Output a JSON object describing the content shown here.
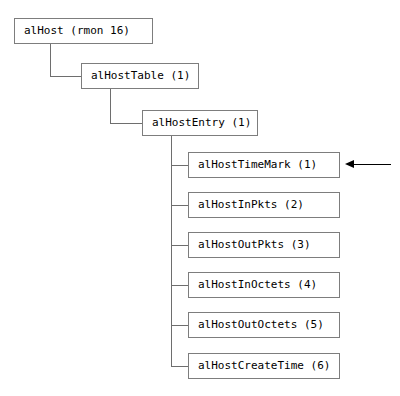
{
  "diagram": {
    "colors": {
      "background": "#ffffff",
      "box_border": "#7d7d7d",
      "edge": "#6e6e6e",
      "arrow": "#000000",
      "text": "#000000"
    },
    "nodes": [
      {
        "id": "alhost",
        "label": "alHost (rmon 16)",
        "x": 14,
        "y": 18,
        "width": 139
      },
      {
        "id": "alhosttable",
        "label": "alHostTable (1)",
        "x": 81,
        "y": 63,
        "width": 118
      },
      {
        "id": "alhostentry",
        "label": "alHostEntry (1)",
        "x": 142,
        "y": 110,
        "width": 116
      },
      {
        "id": "alhosttimemark",
        "label": "alHostTimeMark (1)",
        "x": 188,
        "y": 152,
        "width": 152
      },
      {
        "id": "alhostinpkts",
        "label": "alHostInPkts (2)",
        "x": 188,
        "y": 192,
        "width": 152
      },
      {
        "id": "alhostoutpkts",
        "label": "alHostOutPkts (3)",
        "x": 188,
        "y": 232,
        "width": 152
      },
      {
        "id": "alhostinoctets",
        "label": "alHostInOctets (4)",
        "x": 188,
        "y": 272,
        "width": 152
      },
      {
        "id": "alhostoutoctets",
        "label": "alHostOutOctets (5)",
        "x": 188,
        "y": 312,
        "width": 152
      },
      {
        "id": "alhostcreatetime",
        "label": "alHostCreateTime (6)",
        "x": 188,
        "y": 353,
        "width": 152
      }
    ],
    "edges": [
      {
        "id": "e-alhost-down",
        "orient": "v",
        "x": 50,
        "y": 44,
        "length": 33
      },
      {
        "id": "e-alhost-right",
        "orient": "h",
        "x": 50,
        "y": 76,
        "length": 32
      },
      {
        "id": "e-alhosttable-down",
        "orient": "v",
        "x": 110,
        "y": 89,
        "length": 35
      },
      {
        "id": "e-alhosttable-right",
        "orient": "h",
        "x": 110,
        "y": 123,
        "length": 33
      },
      {
        "id": "e-trunk",
        "orient": "v",
        "x": 171,
        "y": 136,
        "length": 231
      },
      {
        "id": "e-leaf-1",
        "orient": "h",
        "x": 171,
        "y": 165,
        "length": 18
      },
      {
        "id": "e-leaf-2",
        "orient": "h",
        "x": 171,
        "y": 205,
        "length": 18
      },
      {
        "id": "e-leaf-3",
        "orient": "h",
        "x": 171,
        "y": 245,
        "length": 18
      },
      {
        "id": "e-leaf-4",
        "orient": "h",
        "x": 171,
        "y": 285,
        "length": 18
      },
      {
        "id": "e-leaf-5",
        "orient": "h",
        "x": 171,
        "y": 325,
        "length": 18
      },
      {
        "id": "e-leaf-6",
        "orient": "h",
        "x": 171,
        "y": 366,
        "length": 18
      }
    ],
    "annotation_arrow": {
      "id": "timemark-pointer",
      "points_to": "alHostTimeMark (1)",
      "direction": "left",
      "tip_x": 345,
      "tail_x": 391,
      "y": 164
    }
  }
}
